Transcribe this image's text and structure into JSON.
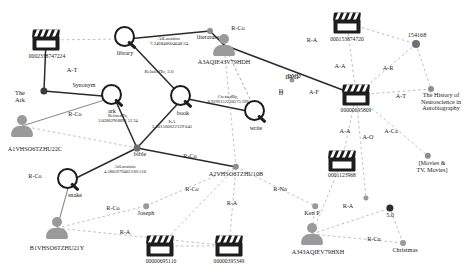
{
  "figure": {
    "type": "knowledge-graph",
    "background": "#ffffff",
    "width": 473,
    "height": 276,
    "colors": {
      "solid_edge": "#2b2b2b",
      "dashed_edge": "#b9b9b9",
      "gray_edge": "#8f8f8f",
      "node_dark": "#1d1d1d",
      "node_gray": "#9a9a9a",
      "dot_dark": "#3b3b3b",
      "dot_gray": "#8d8d8d"
    }
  },
  "nodes": [
    {
      "id": "n_0002338747224",
      "label": "0002338747224",
      "kind": "item",
      "x": 46,
      "y": 40,
      "lx": 47,
      "ly": 54,
      "fs": 5.6
    },
    {
      "id": "n_theark",
      "label": "The\nArk",
      "kind": "dot",
      "x": 44,
      "y": 91,
      "lx": 20,
      "ly": 90,
      "fs": 6.4,
      "r": 3.6,
      "color": "#3b3b3b"
    },
    {
      "id": "n_A1VHSO6TZHU22C",
      "label": "A1VHSO6TZHU22C",
      "kind": "person",
      "x": 22,
      "y": 126,
      "lx": 35,
      "ly": 146,
      "fs": 6.2
    },
    {
      "id": "n_library",
      "label": "library",
      "kind": "concept",
      "x": 127,
      "y": 39,
      "lx": 125,
      "ly": 50,
      "fs": 6.2
    },
    {
      "id": "n_literature",
      "label": "literature",
      "kind": "dot",
      "x": 210,
      "y": 31,
      "lx": 208,
      "ly": 34,
      "fs": 6.2,
      "r": 3.0,
      "color": "#8d8d8d"
    },
    {
      "id": "n_ark",
      "label": "ark",
      "kind": "concept",
      "x": 114,
      "y": 97,
      "lx": 112,
      "ly": 108,
      "fs": 6.2
    },
    {
      "id": "n_book",
      "label": "book",
      "kind": "concept",
      "x": 183,
      "y": 98,
      "lx": 183,
      "ly": 110,
      "fs": 6.2
    },
    {
      "id": "n_write",
      "label": "write",
      "kind": "concept",
      "x": 257,
      "y": 113,
      "lx": 256,
      "ly": 125,
      "fs": 6.2
    },
    {
      "id": "n_bible",
      "label": "bible",
      "kind": "dot",
      "x": 137,
      "y": 148,
      "lx": 140,
      "ly": 151,
      "fs": 6.2,
      "r": 3.4,
      "color": "#6f6f6f"
    },
    {
      "id": "n_snake",
      "label": "snake",
      "kind": "concept",
      "x": 70,
      "y": 181,
      "lx": 75,
      "ly": 192,
      "fs": 6.2
    },
    {
      "id": "n_B1VHSO6TZHU21Y",
      "label": "B1VHSO6TZHU21Y",
      "kind": "person",
      "x": 57,
      "y": 228,
      "lx": 57,
      "ly": 245,
      "fs": 6.2
    },
    {
      "id": "n_A3AQIE43V79HDH",
      "label": "A3AQIE43V79HDH",
      "kind": "person",
      "x": 224,
      "y": 45,
      "lx": 224,
      "ly": 59,
      "fs": 6.2
    },
    {
      "id": "n_A2VHSO6TZHU10B",
      "label": "A2VHSO6TZHU10B",
      "kind": "dot",
      "x": 236,
      "y": 167,
      "lx": 236,
      "ly": 171,
      "fs": 6.2,
      "r": 3.2,
      "color": "#8d8d8d"
    },
    {
      "id": "n_joseph",
      "label": "Joseph",
      "kind": "dot",
      "x": 146,
      "y": 206,
      "lx": 146,
      "ly": 210,
      "fs": 6.2,
      "r": 2.8,
      "color": "#9a9a9a"
    },
    {
      "id": "n_00000695110",
      "label": "00000695110",
      "kind": "item",
      "x": 160,
      "y": 246,
      "lx": 161,
      "ly": 259,
      "fs": 5.6
    },
    {
      "id": "n_00000395349",
      "label": "00000395349",
      "kind": "item",
      "x": 229,
      "y": 246,
      "lx": 229,
      "ly": 259,
      "fs": 5.6
    },
    {
      "id": "n_kenp",
      "label": "Ken P",
      "kind": "dot",
      "x": 315,
      "y": 206,
      "lx": 312,
      "ly": 210,
      "fs": 6.2,
      "r": 2.8,
      "color": "#9a9a9a"
    },
    {
      "id": "n_A343AQIEV79HXH",
      "label": "A343AQIEV79HXH",
      "kind": "person",
      "x": 312,
      "y": 234,
      "lx": 318,
      "ly": 249,
      "fs": 6.2
    },
    {
      "id": "n_christmas",
      "label": "Christmas",
      "kind": "dot",
      "x": 403,
      "y": 243,
      "lx": 405,
      "ly": 247,
      "fs": 6.2,
      "r": 3.0,
      "color": "#9a9a9a"
    },
    {
      "id": "n_50",
      "label": "5.0",
      "kind": "dot",
      "x": 390,
      "y": 208,
      "lx": 390,
      "ly": 212,
      "fs": 6.2,
      "r": 3.6,
      "color": "#2e2e2e"
    },
    {
      "id": "n_000153874720",
      "label": "000153874720",
      "kind": "item",
      "x": 347,
      "y": 23,
      "lx": 347,
      "ly": 37,
      "fs": 5.6
    },
    {
      "id": "n_154168",
      "label": "154168",
      "kind": "dot",
      "x": 416,
      "y": 44,
      "lx": 417,
      "ly": 32,
      "fs": 6.2,
      "r": 4.0,
      "color": "#6f6f6f"
    },
    {
      "id": "n_00000695809",
      "label": "00000695809",
      "kind": "item",
      "x": 356,
      "y": 95,
      "lx": 356,
      "ly": 108,
      "fs": 5.6
    },
    {
      "id": "n_neuro",
      "label": "The History of\nNeuroscience in\nAutobiography",
      "kind": "dot",
      "x": 431,
      "y": 89,
      "lx": 441,
      "ly": 92,
      "fs": 6.2,
      "r": 3.0,
      "color": "#8d8d8d"
    },
    {
      "id": "n_movies",
      "label": "[Movies &\nTV, Movies]",
      "kind": "dot",
      "x": 428,
      "y": 156,
      "lx": 432,
      "ly": 160,
      "fs": 6.2,
      "r": 3.2,
      "color": "#8d8d8d"
    },
    {
      "id": "n_0001123968",
      "label": "0001123968",
      "kind": "item",
      "x": 342,
      "y": 161,
      "lx": 342,
      "ly": 173,
      "fs": 5.6
    },
    {
      "id": "n_unlabeled_mid",
      "label": "",
      "kind": "dot",
      "x": 366,
      "y": 198,
      "lx": 366,
      "ly": 201,
      "fs": 6.0,
      "r": 2.6,
      "color": "#9a9a9a"
    },
    {
      "id": "n_dvd",
      "label": "DVD",
      "kind": "dot",
      "x": 292,
      "y": 80,
      "lx": 292,
      "ly": 74,
      "fs": 6.2,
      "r": 2.6,
      "color": "#9a9a9a"
    },
    {
      "id": "n_d",
      "label": "D",
      "kind": "dot",
      "x": 283,
      "y": 95,
      "lx": 281,
      "ly": 90,
      "fs": 6.2,
      "r": 0.0,
      "color": "#9a9a9a"
    }
  ],
  "edges": [
    {
      "id": "e1",
      "from": "n_0002338747224",
      "to": "n_theark",
      "style": "solid",
      "label": "A-T",
      "lx": 72,
      "ly": 70,
      "fs": 6.4
    },
    {
      "id": "e2",
      "from": "n_0002338747224",
      "to": "n_library",
      "style": "dashed",
      "label": "",
      "lx": 0,
      "ly": 0,
      "fs": 6.0
    },
    {
      "id": "e3",
      "from": "n_theark",
      "to": "n_ark",
      "style": "solid",
      "label": "Synonym",
      "lx": 84,
      "ly": 85,
      "fs": 6.0
    },
    {
      "id": "e4",
      "from": "n_A1VHSO6TZHU22C",
      "to": "n_ark",
      "style": "gray",
      "label": "R-Co",
      "lx": 75,
      "ly": 114,
      "fs": 6.2
    },
    {
      "id": "e5",
      "from": "n_A1VHSO6TZHU22C",
      "to": "n_bible",
      "style": "dashed",
      "label": "",
      "lx": 0,
      "ly": 0,
      "fs": 6.0
    },
    {
      "id": "e6",
      "from": "n_library",
      "to": "n_literature",
      "style": "solid",
      "label": "AtLocation\n7.246848604048 34",
      "lx": 169,
      "ly": 41,
      "fs": 4.8
    },
    {
      "id": "e7",
      "from": "n_library",
      "to": "n_book",
      "style": "solid",
      "label": "RelatedTo, 3.0",
      "lx": 159,
      "ly": 72,
      "fs": 5.0
    },
    {
      "id": "e8",
      "from": "n_literature",
      "to": "n_A3AQIE43V79HDH",
      "style": "solid",
      "label": "R-Co",
      "lx": 238,
      "ly": 28,
      "fs": 6.2
    },
    {
      "id": "e9",
      "from": "n_ark",
      "to": "n_bible",
      "style": "solid",
      "label": "RelatedTo,\n2.03862968891 52 34",
      "lx": 118,
      "ly": 119,
      "fs": 4.6
    },
    {
      "id": "e10",
      "from": "n_book",
      "to": "n_bible",
      "style": "solid",
      "label": "IsA\n3.301560622129 041",
      "lx": 172,
      "ly": 124,
      "fs": 4.8
    },
    {
      "id": "e11",
      "from": "n_book",
      "to": "n_write",
      "style": "solid",
      "label": "CreatedBy,\n8.9296152220275 599",
      "lx": 228,
      "ly": 100,
      "fs": 4.6
    },
    {
      "id": "e12",
      "from": "n_bible",
      "to": "n_A2VHSO6TZHU10B",
      "style": "solid",
      "label": "R-Co",
      "lx": 190,
      "ly": 156,
      "fs": 6.2
    },
    {
      "id": "e13",
      "from": "n_snake",
      "to": "n_bible",
      "style": "solid",
      "label": "AtLocation\n4.58059794023 86 510",
      "lx": 125,
      "ly": 170,
      "fs": 4.6
    },
    {
      "id": "e14",
      "from": "n_B1VHSO6TZHU21Y",
      "to": "n_snake",
      "style": "gray",
      "label": "R-Co",
      "lx": 35,
      "ly": 176,
      "fs": 6.2
    },
    {
      "id": "e15",
      "from": "n_B1VHSO6TZHU21Y",
      "to": "n_joseph",
      "style": "dashed",
      "label": "R-Co",
      "lx": 113,
      "ly": 208,
      "fs": 6.2
    },
    {
      "id": "e16",
      "from": "n_B1VHSO6TZHU21Y",
      "to": "n_00000395349",
      "style": "dashed",
      "label": "R-A",
      "lx": 125,
      "ly": 232,
      "fs": 6.2
    },
    {
      "id": "e17",
      "from": "n_joseph",
      "to": "n_A2VHSO6TZHU10B",
      "style": "dashed",
      "label": "R-Co",
      "lx": 192,
      "ly": 189,
      "fs": 6.2
    },
    {
      "id": "e18",
      "from": "n_A2VHSO6TZHU10B",
      "to": "n_00000395349",
      "style": "dashed",
      "label": "R-A",
      "lx": 232,
      "ly": 203,
      "fs": 6.2
    },
    {
      "id": "e19",
      "from": "n_A2VHSO6TZHU10B",
      "to": "n_kenp",
      "style": "dashed",
      "label": "R-Na",
      "lx": 280,
      "ly": 189,
      "fs": 6.2
    },
    {
      "id": "e20",
      "from": "n_kenp",
      "to": "n_A343AQIEV79HXH",
      "style": "dashed",
      "label": "",
      "lx": 0,
      "ly": 0,
      "fs": 6.0
    },
    {
      "id": "e21",
      "from": "n_A343AQIEV79HXH",
      "to": "n_50",
      "style": "dashed",
      "label": "R-A",
      "lx": 348,
      "ly": 206,
      "fs": 6.2
    },
    {
      "id": "e22",
      "from": "n_A343AQIEV79HXH",
      "to": "n_christmas",
      "style": "dashed",
      "label": "R-Cu",
      "lx": 374,
      "ly": 239,
      "fs": 6.2
    },
    {
      "id": "e23",
      "from": "n_00000695110",
      "to": "n_00000395349",
      "style": "dashed",
      "label": "",
      "lx": 0,
      "ly": 0,
      "fs": 6.0
    },
    {
      "id": "e24",
      "from": "n_000153874720",
      "to": "n_154168",
      "style": "dashed",
      "label": "",
      "lx": 0,
      "ly": 0,
      "fs": 6.0
    },
    {
      "id": "e25",
      "from": "n_000153874720",
      "to": "n_00000695809",
      "style": "dashed",
      "label": "A-A",
      "lx": 340,
      "ly": 66,
      "fs": 6.2
    },
    {
      "id": "e26",
      "from": "n_154168",
      "to": "n_00000695809",
      "style": "dashed",
      "label": "A-R",
      "lx": 388,
      "ly": 68,
      "fs": 6.2
    },
    {
      "id": "e27",
      "from": "n_00000695809",
      "to": "n_neuro",
      "style": "dashed",
      "label": "A-T",
      "lx": 401,
      "ly": 96,
      "fs": 6.2
    },
    {
      "id": "e28",
      "from": "n_A3AQIE43V79HDH",
      "to": "n_00000695809",
      "style": "solid",
      "label": "R-A",
      "lx": 312,
      "ly": 40,
      "fs": 6.2
    },
    {
      "id": "e29",
      "from": "n_00000695809",
      "to": "n_0001123968",
      "style": "dashed",
      "label": "A-A",
      "lx": 345,
      "ly": 131,
      "fs": 6.2
    },
    {
      "id": "e30",
      "from": "n_00000695809",
      "to": "n_movies",
      "style": "dashed",
      "label": "A-Ca",
      "lx": 391,
      "ly": 131,
      "fs": 6.2
    },
    {
      "id": "e31",
      "from": "n_00000695809",
      "to": "n_unlabeled_mid",
      "style": "dashed",
      "label": "A-O",
      "lx": 368,
      "ly": 137,
      "fs": 6.2
    },
    {
      "id": "e32",
      "from": "n_A3AQIE43V79HDH",
      "to": "n_write",
      "style": "dashed",
      "label": "A-F",
      "lx": 314,
      "ly": 92,
      "fs": 6.2
    },
    {
      "id": "e33",
      "from": "n_write",
      "to": "n_A3AQIE43V79HDH",
      "style": "dashed",
      "label": "",
      "lx": 0,
      "ly": 0,
      "fs": 6.0
    },
    {
      "id": "e34",
      "from": "n_0001123968",
      "to": "n_A343AQIEV79HXH",
      "style": "dashed",
      "label": "",
      "lx": 0,
      "ly": 0,
      "fs": 6.0
    },
    {
      "id": "e35",
      "from": "n_A2VHSO6TZHU10B",
      "to": "n_A3AQIE43V79HDH",
      "style": "dashed",
      "label": "",
      "lx": 0,
      "ly": 0,
      "fs": 6.0
    },
    {
      "id": "e36",
      "from": "n_154168",
      "to": "n_neuro",
      "style": "dashed",
      "label": "",
      "lx": 0,
      "ly": 0,
      "fs": 6.0
    },
    {
      "id": "e37",
      "from": "n_00000695110",
      "to": "n_A2VHSO6TZHU10B",
      "style": "dashed",
      "label": "",
      "lx": 0,
      "ly": 0,
      "fs": 6.0
    },
    {
      "id": "e38",
      "from": "n_christmas",
      "to": "n_50",
      "style": "dashed",
      "label": "",
      "lx": 0,
      "ly": 0,
      "fs": 6.0
    }
  ],
  "free_labels": [
    {
      "id": "fl_dvd",
      "text": "DVD",
      "x": 294,
      "y": 76,
      "fs": 6.2
    },
    {
      "id": "fl_d",
      "text": "D",
      "x": 281,
      "y": 91,
      "fs": 6.2
    }
  ]
}
